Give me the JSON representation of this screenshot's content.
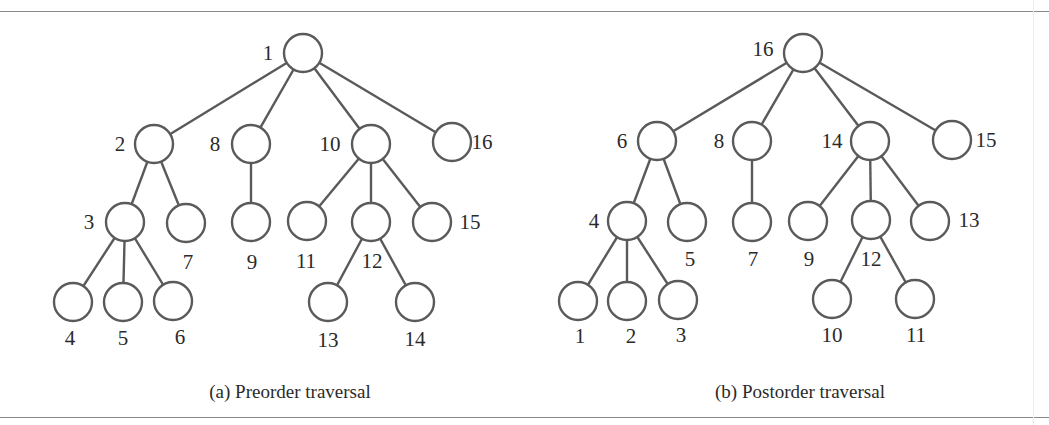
{
  "figure": {
    "node_radius": 19,
    "colors": {
      "edge": "#5a5a5a",
      "text": "#2a2a2a",
      "rule": "#8a8a8a"
    },
    "rules": {
      "top_y": 11,
      "bottom_y": 417
    },
    "panels": [
      {
        "id": "preorder",
        "caption": "(a) Preorder traversal",
        "caption_pos": [
          290,
          398
        ],
        "nodes": [
          {
            "id": "r",
            "label": "1",
            "x": 303,
            "y": 53,
            "lx": 268,
            "ly": 60
          },
          {
            "id": "a",
            "label": "2",
            "x": 154,
            "y": 144,
            "lx": 120,
            "ly": 151
          },
          {
            "id": "b",
            "label": "8",
            "x": 251,
            "y": 144,
            "lx": 215,
            "ly": 151
          },
          {
            "id": "c",
            "label": "10",
            "x": 371,
            "y": 144,
            "lx": 330,
            "ly": 151
          },
          {
            "id": "d",
            "label": "16",
            "x": 452,
            "y": 142,
            "lx": 482,
            "ly": 149
          },
          {
            "id": "a1",
            "label": "3",
            "x": 125,
            "y": 222,
            "lx": 89,
            "ly": 229
          },
          {
            "id": "a2",
            "label": "7",
            "x": 186,
            "y": 223,
            "lx": 188,
            "ly": 269
          },
          {
            "id": "b1",
            "label": "9",
            "x": 251,
            "y": 222,
            "lx": 252,
            "ly": 269
          },
          {
            "id": "c1",
            "label": "11",
            "x": 307,
            "y": 221,
            "lx": 306,
            "ly": 268
          },
          {
            "id": "c2",
            "label": "12",
            "x": 371,
            "y": 222,
            "lx": 372,
            "ly": 268
          },
          {
            "id": "c3",
            "label": "15",
            "x": 432,
            "y": 222,
            "lx": 470,
            "ly": 229
          },
          {
            "id": "a11",
            "label": "4",
            "x": 73,
            "y": 302,
            "lx": 70,
            "ly": 345
          },
          {
            "id": "a12",
            "label": "5",
            "x": 123,
            "y": 302,
            "lx": 123,
            "ly": 345
          },
          {
            "id": "a13",
            "label": "6",
            "x": 173,
            "y": 301,
            "lx": 180,
            "ly": 344
          },
          {
            "id": "c21",
            "label": "13",
            "x": 328,
            "y": 302,
            "lx": 328,
            "ly": 347
          },
          {
            "id": "c22",
            "label": "14",
            "x": 415,
            "y": 302,
            "lx": 415,
            "ly": 346
          }
        ],
        "edges": [
          [
            "r",
            "a"
          ],
          [
            "r",
            "b"
          ],
          [
            "r",
            "c"
          ],
          [
            "r",
            "d"
          ],
          [
            "a",
            "a1"
          ],
          [
            "a",
            "a2"
          ],
          [
            "b",
            "b1"
          ],
          [
            "c",
            "c1"
          ],
          [
            "c",
            "c2"
          ],
          [
            "c",
            "c3"
          ],
          [
            "a1",
            "a11"
          ],
          [
            "a1",
            "a12"
          ],
          [
            "a1",
            "a13"
          ],
          [
            "c2",
            "c21"
          ],
          [
            "c2",
            "c22"
          ]
        ]
      },
      {
        "id": "postorder",
        "caption": "(b) Postorder traversal",
        "caption_pos": [
          800,
          398
        ],
        "nodes": [
          {
            "id": "r",
            "label": "16",
            "x": 803,
            "y": 53,
            "lx": 763,
            "ly": 56
          },
          {
            "id": "a",
            "label": "6",
            "x": 657,
            "y": 141,
            "lx": 622,
            "ly": 148
          },
          {
            "id": "b",
            "label": "8",
            "x": 752,
            "y": 141,
            "lx": 719,
            "ly": 148
          },
          {
            "id": "c",
            "label": "14",
            "x": 870,
            "y": 141,
            "lx": 832,
            "ly": 148
          },
          {
            "id": "d",
            "label": "15",
            "x": 952,
            "y": 140,
            "lx": 986,
            "ly": 147
          },
          {
            "id": "a1",
            "label": "4",
            "x": 627,
            "y": 221,
            "lx": 594,
            "ly": 228
          },
          {
            "id": "a2",
            "label": "5",
            "x": 687,
            "y": 222,
            "lx": 690,
            "ly": 266
          },
          {
            "id": "b1",
            "label": "7",
            "x": 752,
            "y": 222,
            "lx": 753,
            "ly": 266
          },
          {
            "id": "c1",
            "label": "9",
            "x": 808,
            "y": 221,
            "lx": 809,
            "ly": 266
          },
          {
            "id": "c2",
            "label": "12",
            "x": 871,
            "y": 220,
            "lx": 871,
            "ly": 266
          },
          {
            "id": "c3",
            "label": "13",
            "x": 930,
            "y": 221,
            "lx": 969,
            "ly": 227
          },
          {
            "id": "a11",
            "label": "1",
            "x": 578,
            "y": 301,
            "lx": 580,
            "ly": 343
          },
          {
            "id": "a12",
            "label": "2",
            "x": 627,
            "y": 301,
            "lx": 631,
            "ly": 343
          },
          {
            "id": "a13",
            "label": "3",
            "x": 678,
            "y": 300,
            "lx": 681,
            "ly": 342
          },
          {
            "id": "c21",
            "label": "10",
            "x": 832,
            "y": 299,
            "lx": 832,
            "ly": 342
          },
          {
            "id": "c22",
            "label": "11",
            "x": 915,
            "y": 299,
            "lx": 916,
            "ly": 342
          }
        ],
        "edges": [
          [
            "r",
            "a"
          ],
          [
            "r",
            "b"
          ],
          [
            "r",
            "c"
          ],
          [
            "r",
            "d"
          ],
          [
            "a",
            "a1"
          ],
          [
            "a",
            "a2"
          ],
          [
            "b",
            "b1"
          ],
          [
            "c",
            "c1"
          ],
          [
            "c",
            "c2"
          ],
          [
            "c",
            "c3"
          ],
          [
            "a1",
            "a11"
          ],
          [
            "a1",
            "a12"
          ],
          [
            "a1",
            "a13"
          ],
          [
            "c2",
            "c21"
          ],
          [
            "c2",
            "c22"
          ]
        ]
      }
    ]
  }
}
